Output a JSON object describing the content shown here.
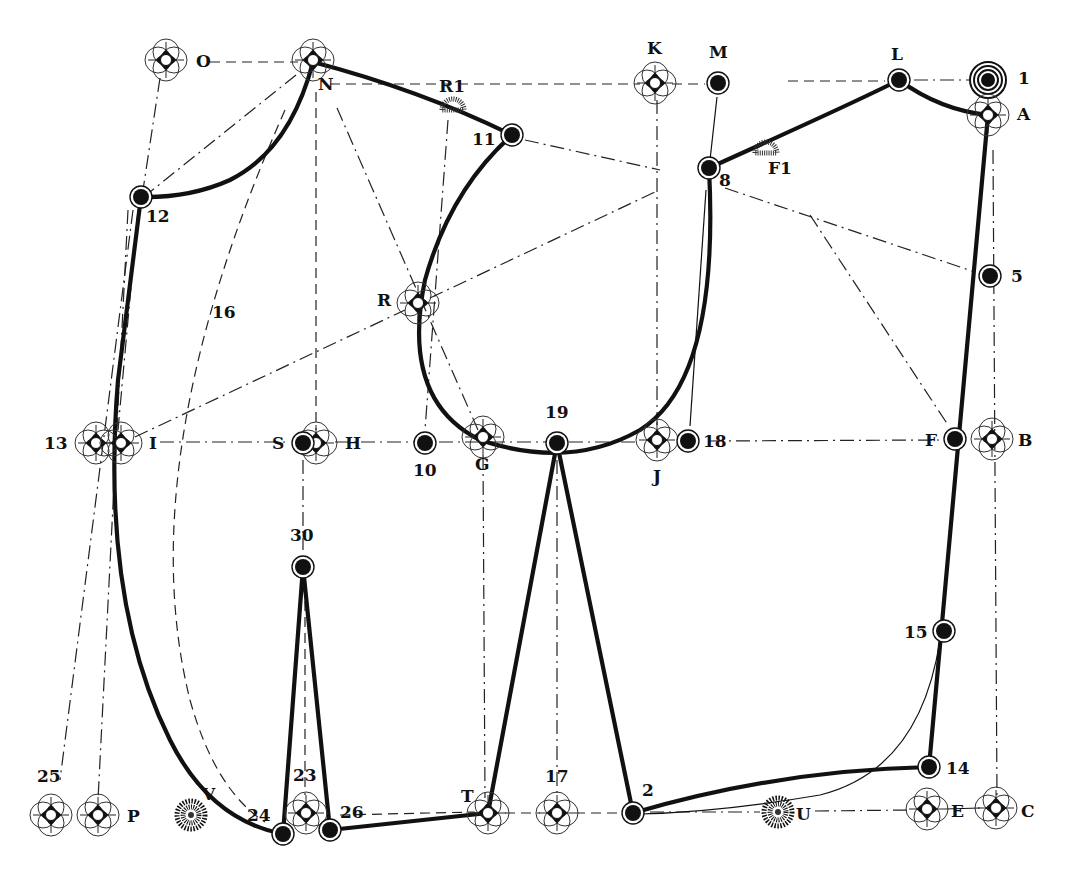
{
  "diagram": {
    "type": "garment-pattern-draft",
    "colors": {
      "ink": "#111111",
      "background": "#ffffff"
    },
    "points": {
      "O": {
        "label": "O",
        "x": 166,
        "y": 60,
        "marker": "compass-cross"
      },
      "N": {
        "label": "N",
        "x": 313,
        "y": 60,
        "marker": "compass-cross"
      },
      "K": {
        "label": "K",
        "x": 655,
        "y": 83,
        "marker": "compass-cross"
      },
      "M": {
        "label": "M",
        "x": 718,
        "y": 83,
        "marker": "dot"
      },
      "L": {
        "label": "L",
        "x": 899,
        "y": 80,
        "marker": "dot"
      },
      "P1": {
        "label": "1",
        "x": 988,
        "y": 80,
        "marker": "target"
      },
      "A": {
        "label": "A",
        "x": 988,
        "y": 115,
        "marker": "compass-cross"
      },
      "R1": {
        "label": "R1",
        "x": 453,
        "y": 107,
        "marker": "sunburst"
      },
      "P11": {
        "label": "11",
        "x": 512,
        "y": 135,
        "marker": "dot"
      },
      "P8": {
        "label": "8",
        "x": 709,
        "y": 168,
        "marker": "dot"
      },
      "F1": {
        "label": "F1",
        "x": 766,
        "y": 150,
        "marker": "sunburst"
      },
      "P12": {
        "label": "12",
        "x": 141,
        "y": 197,
        "marker": "dot"
      },
      "P5": {
        "label": "5",
        "x": 990,
        "y": 276,
        "marker": "dot"
      },
      "P16": {
        "label": "16",
        "x": 225,
        "y": 310,
        "marker": "none"
      },
      "R": {
        "label": "R",
        "x": 418,
        "y": 303,
        "marker": "compass-cross"
      },
      "P13": {
        "label": "13",
        "x": 96,
        "y": 443,
        "marker": "compass-cross"
      },
      "I": {
        "label": "I",
        "x": 121,
        "y": 443,
        "marker": "compass-cross"
      },
      "S": {
        "label": "S",
        "x": 303,
        "y": 443,
        "marker": "dot"
      },
      "H": {
        "label": "H",
        "x": 316,
        "y": 443,
        "marker": "compass-cross"
      },
      "P10": {
        "label": "10",
        "x": 425,
        "y": 443,
        "marker": "dot"
      },
      "G": {
        "label": "G",
        "x": 483,
        "y": 437,
        "marker": "compass-cross"
      },
      "P19": {
        "label": "19",
        "x": 557,
        "y": 443,
        "marker": "dot"
      },
      "J": {
        "label": "J",
        "x": 657,
        "y": 440,
        "marker": "compass-cross"
      },
      "P18": {
        "label": "18",
        "x": 688,
        "y": 441,
        "marker": "dot"
      },
      "F": {
        "label": "F",
        "x": 955,
        "y": 439,
        "marker": "dot"
      },
      "B": {
        "label": "B",
        "x": 992,
        "y": 439,
        "marker": "compass-cross"
      },
      "P30": {
        "label": "30",
        "x": 303,
        "y": 567,
        "marker": "dot"
      },
      "P15": {
        "label": "15",
        "x": 944,
        "y": 631,
        "marker": "dot"
      },
      "P14": {
        "label": "14",
        "x": 929,
        "y": 767,
        "marker": "dot"
      },
      "P25": {
        "label": "25",
        "x": 51,
        "y": 815,
        "marker": "compass-cross"
      },
      "Pp": {
        "label": "P",
        "x": 98,
        "y": 815,
        "marker": "compass-cross"
      },
      "V": {
        "label": "V",
        "x": 191,
        "y": 815,
        "marker": "sunburst"
      },
      "P24": {
        "label": "24",
        "x": 283,
        "y": 834,
        "marker": "dot"
      },
      "P23": {
        "label": "23",
        "x": 306,
        "y": 813,
        "marker": "compass-cross"
      },
      "P26": {
        "label": "26",
        "x": 330,
        "y": 830,
        "marker": "dot"
      },
      "T": {
        "label": "T",
        "x": 488,
        "y": 813,
        "marker": "compass-cross"
      },
      "P17": {
        "label": "17",
        "x": 557,
        "y": 813,
        "marker": "compass-cross"
      },
      "P2": {
        "label": "2",
        "x": 633,
        "y": 813,
        "marker": "dot"
      },
      "U": {
        "label": "U",
        "x": 778,
        "y": 812,
        "marker": "sunburst"
      },
      "E": {
        "label": "E",
        "x": 927,
        "y": 809,
        "marker": "compass-cross"
      },
      "C": {
        "label": "C",
        "x": 996,
        "y": 808,
        "marker": "compass-cross"
      }
    },
    "labels": [
      {
        "id": "O",
        "text": "O",
        "x": 196,
        "y": 67
      },
      {
        "id": "N",
        "text": "N",
        "x": 318,
        "y": 90
      },
      {
        "id": "K",
        "text": "K",
        "x": 647,
        "y": 54
      },
      {
        "id": "M",
        "text": "M",
        "x": 709,
        "y": 58
      },
      {
        "id": "L",
        "text": "L",
        "x": 891,
        "y": 60
      },
      {
        "id": "1",
        "text": "1",
        "x": 1018,
        "y": 84
      },
      {
        "id": "A",
        "text": "A",
        "x": 1017,
        "y": 120
      },
      {
        "id": "R1",
        "text": "R1",
        "x": 439,
        "y": 92
      },
      {
        "id": "11",
        "text": "11",
        "x": 472,
        "y": 145
      },
      {
        "id": "8",
        "text": "8",
        "x": 719,
        "y": 186
      },
      {
        "id": "F1",
        "text": "F1",
        "x": 768,
        "y": 174
      },
      {
        "id": "12",
        "text": "12",
        "x": 146,
        "y": 222
      },
      {
        "id": "5",
        "text": "5",
        "x": 1011,
        "y": 282
      },
      {
        "id": "16",
        "text": "16",
        "x": 212,
        "y": 318
      },
      {
        "id": "R",
        "text": "R",
        "x": 377,
        "y": 306
      },
      {
        "id": "13",
        "text": "13",
        "x": 44,
        "y": 449
      },
      {
        "id": "I",
        "text": "I",
        "x": 149,
        "y": 449
      },
      {
        "id": "S",
        "text": "S",
        "x": 272,
        "y": 449
      },
      {
        "id": "H",
        "text": "H",
        "x": 345,
        "y": 449
      },
      {
        "id": "10",
        "text": "10",
        "x": 413,
        "y": 476
      },
      {
        "id": "G",
        "text": "G",
        "x": 475,
        "y": 470
      },
      {
        "id": "19",
        "text": "19",
        "x": 545,
        "y": 418
      },
      {
        "id": "J",
        "text": "J",
        "x": 653,
        "y": 482
      },
      {
        "id": "18",
        "text": "18",
        "x": 703,
        "y": 447
      },
      {
        "id": "F",
        "text": "F",
        "x": 925,
        "y": 446
      },
      {
        "id": "B",
        "text": "B",
        "x": 1018,
        "y": 446
      },
      {
        "id": "30",
        "text": "30",
        "x": 290,
        "y": 541
      },
      {
        "id": "15",
        "text": "15",
        "x": 904,
        "y": 638
      },
      {
        "id": "14",
        "text": "14",
        "x": 946,
        "y": 774
      },
      {
        "id": "25",
        "text": "25",
        "x": 37,
        "y": 782
      },
      {
        "id": "P",
        "text": "P",
        "x": 127,
        "y": 822
      },
      {
        "id": "V",
        "text": "V",
        "x": 202,
        "y": 800
      },
      {
        "id": "24",
        "text": "24",
        "x": 247,
        "y": 821
      },
      {
        "id": "23",
        "text": "23",
        "x": 293,
        "y": 781
      },
      {
        "id": "26",
        "text": "26",
        "x": 340,
        "y": 818
      },
      {
        "id": "T",
        "text": "T",
        "x": 461,
        "y": 802
      },
      {
        "id": "17",
        "text": "17",
        "x": 545,
        "y": 782
      },
      {
        "id": "2",
        "text": "2",
        "x": 642,
        "y": 796
      },
      {
        "id": "U",
        "text": "U",
        "x": 796,
        "y": 820
      },
      {
        "id": "E",
        "text": "E",
        "x": 951,
        "y": 817
      },
      {
        "id": "C",
        "text": "C",
        "x": 1021,
        "y": 817
      }
    ]
  }
}
